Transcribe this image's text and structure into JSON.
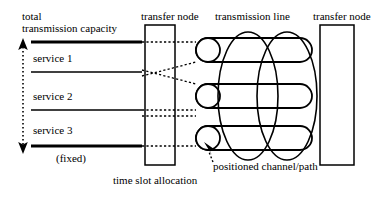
{
  "diagram": {
    "labels": {
      "total_line1": "total",
      "total_line2": "transmission capacity",
      "service_1": "service 1",
      "service_2": "service 2",
      "service_3": "service 3",
      "fixed": "(fixed)",
      "transfer_node_left": "transfer node",
      "transmission_line": "transmission line",
      "transfer_node_right": "transfer node",
      "time_slot_allocation": "time slot allocation",
      "positioned_channel_path": "positioned channel/path"
    },
    "capacity_axis": {
      "name": "total-transmission-capacity-arrow",
      "style": "dotted double-headed vertical arrow",
      "top_y": 40,
      "bottom_y": 150
    },
    "service_bands": [
      {
        "name": "service 1",
        "top_rule": "thick",
        "bottom_rule": "thin"
      },
      {
        "name": "service 2",
        "top_rule": "thin",
        "bottom_rule": "thin"
      },
      {
        "name": "service 3",
        "top_rule": "thin",
        "bottom_rule": "thick"
      }
    ],
    "nodes": [
      {
        "name": "transfer node",
        "side": "left"
      },
      {
        "name": "transfer node",
        "side": "right"
      }
    ],
    "channels": [
      {
        "index": 1,
        "label": "channel 1"
      },
      {
        "index": 2,
        "label": "channel 2"
      },
      {
        "index": 3,
        "label": "channel 3",
        "annotated": true
      }
    ],
    "colors": {
      "stroke": "#000000",
      "background": "#ffffff"
    }
  }
}
